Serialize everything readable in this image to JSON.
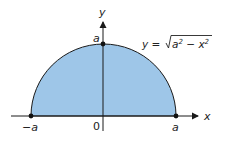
{
  "figure": {
    "colors": {
      "fill": "#9ec6e8",
      "stroke": "#1a1a1a",
      "background": "#ffffff"
    },
    "axes": {
      "x_label": "x",
      "y_label": "y"
    },
    "labels": {
      "neg_a": "−a",
      "origin": "0",
      "pos_a": "a",
      "top_a": "a"
    },
    "equation": {
      "lhs": "y = ",
      "radicand_a": "a",
      "radicand_a_exp": "2",
      "minus": " − ",
      "radicand_x": "x",
      "radicand_x_exp": "2"
    },
    "points": [
      {
        "name": "left-endpoint",
        "label": "(−a, 0)"
      },
      {
        "name": "top-point",
        "label": "(0, a)"
      },
      {
        "name": "right-endpoint",
        "label": "(a, 0)"
      }
    ]
  }
}
